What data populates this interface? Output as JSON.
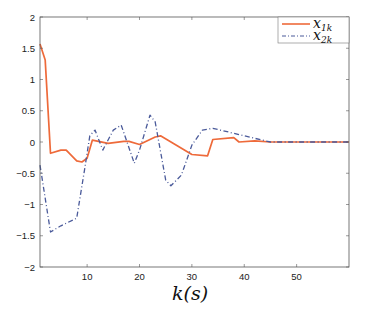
{
  "chart_data": {
    "type": "line",
    "title": "",
    "xlabel": "k(s)",
    "ylabel": "",
    "xlim": [
      1,
      60
    ],
    "ylim": [
      -2,
      2
    ],
    "xticks": [
      10,
      20,
      30,
      40,
      50
    ],
    "yticks": [
      -2,
      -1.5,
      -1,
      -0.5,
      0,
      0.5,
      1,
      1.5,
      2
    ],
    "ytick_labels": [
      "−2",
      "−1.5",
      "−1",
      "−0.5",
      "0",
      "0.5",
      "1",
      "1.5",
      "2"
    ],
    "xtick_labels": [
      "10",
      "20",
      "30",
      "40",
      "50"
    ],
    "grid": false,
    "legend_position": "upper right",
    "series": [
      {
        "name": "x_{1k}",
        "label_main": "x",
        "label_sub": "1k",
        "color": "#ee6a3a",
        "style": "solid",
        "x": [
          1,
          2,
          3,
          5,
          6,
          8,
          9,
          10,
          11,
          14,
          17,
          18,
          20,
          23,
          24,
          30,
          33,
          34,
          38,
          39,
          42,
          45,
          50,
          55,
          60
        ],
        "y": [
          1.57,
          1.31,
          -0.18,
          -0.13,
          -0.13,
          -0.3,
          -0.32,
          -0.26,
          0.03,
          -0.02,
          0.01,
          0.01,
          -0.04,
          0.08,
          0.1,
          -0.2,
          -0.22,
          0.04,
          0.07,
          0.0,
          0.02,
          0.0,
          0.0,
          0.0,
          0.0
        ]
      },
      {
        "name": "x_{2k}",
        "label_main": "x",
        "label_sub": "2k",
        "color": "#4a5a9a",
        "style": "dashdot",
        "x": [
          1,
          3,
          5,
          8,
          9.5,
          10.5,
          11.5,
          13,
          15,
          16.5,
          19,
          20,
          22,
          23,
          25,
          26,
          28,
          30,
          32,
          34,
          38,
          42,
          45,
          50,
          55,
          60
        ],
        "y": [
          -0.37,
          -1.44,
          -1.34,
          -1.22,
          -0.45,
          0.1,
          0.19,
          -0.13,
          0.19,
          0.27,
          -0.34,
          -0.13,
          0.43,
          0.32,
          -0.61,
          -0.7,
          -0.53,
          -0.05,
          0.19,
          0.22,
          0.14,
          0.06,
          0.0,
          0.0,
          0.0,
          0.0
        ]
      }
    ]
  }
}
